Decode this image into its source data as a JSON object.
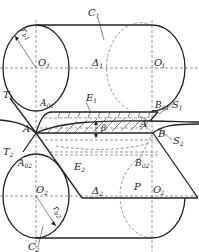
{
  "figure": {
    "type": "technical-diagram",
    "colors": {
      "line": "#222222",
      "background": "#ffffff"
    }
  },
  "labels": {
    "C1": {
      "main": "C",
      "sub": "1"
    },
    "C2": {
      "main": "C",
      "sub": "2"
    },
    "rb1": {
      "main": "r",
      "sub": "b1"
    },
    "rb2": {
      "main": "r",
      "sub": "b2"
    },
    "O1": {
      "main": "O",
      "sub": "1"
    },
    "O1p": {
      "main": "O",
      "sub": "1",
      "prime": "′"
    },
    "O2": {
      "main": "O",
      "sub": "2"
    },
    "O2p": {
      "main": "O",
      "sub": "2",
      "prime": "′"
    },
    "Delta1": {
      "main": "Δ",
      "sub": "1"
    },
    "Delta2": {
      "main": "Δ",
      "sub": "2"
    },
    "T1": {
      "main": "T",
      "sub": "1"
    },
    "T2": {
      "main": "T",
      "sub": "2"
    },
    "A01": {
      "main": "A",
      "sub": "01"
    },
    "A02": {
      "main": "A",
      "sub": "02"
    },
    "B01": {
      "main": "B",
      "sub": "01"
    },
    "B02": {
      "main": "B",
      "sub": "02"
    },
    "E1": {
      "main": "E",
      "sub": "1"
    },
    "E2": {
      "main": "E",
      "sub": "2"
    },
    "S1": {
      "main": "S",
      "sub": "1"
    },
    "S2": {
      "main": "S",
      "sub": "2"
    },
    "A": {
      "main": "A"
    },
    "Ap": {
      "main": "A",
      "prime": "′"
    },
    "B": {
      "main": "B"
    },
    "beta": {
      "main": "β"
    },
    "P": {
      "main": "P"
    }
  }
}
